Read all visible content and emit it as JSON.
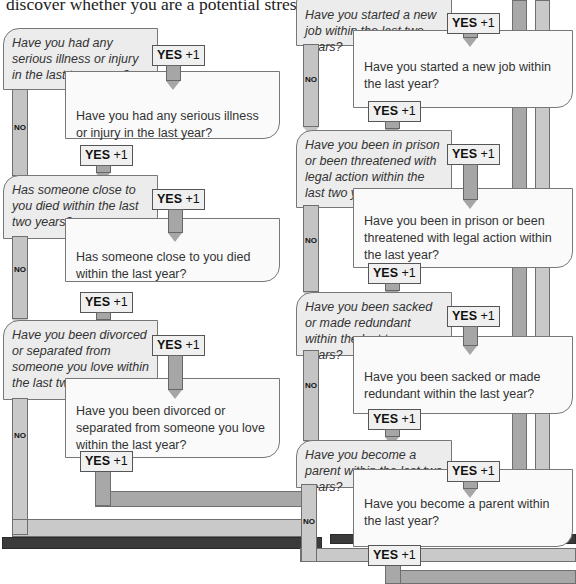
{
  "intro": "discover whether you are a potential stress victim.",
  "yes_label": "YES",
  "yes_points": "+1",
  "no_label": "NO",
  "colors": {
    "bar_mid": "#a8a8a8",
    "bar_light": "#c9c9c9",
    "bar_dark": "#3a3a3a",
    "q2_box": "#ececec",
    "q1_box": "#fafafa"
  },
  "left_column": [
    {
      "two_years": "Have you had any serious illness or injury in the last two years?",
      "last_year": "Have you had any serious illness or injury in the last year?"
    },
    {
      "two_years": "Has someone close to you died within the last two years?",
      "last_year": "Has someone close to you died within the last year?"
    },
    {
      "two_years": "Have you been divorced or separated from someone you love within the last two years?",
      "last_year": "Have you been divorced or separated from someone you love within the last year?"
    }
  ],
  "right_column": [
    {
      "two_years": "Have you started a new job within the last two years?",
      "last_year": "Have you started a new job within the last year?"
    },
    {
      "two_years": "Have you been in prison or been threatened with legal action within the last two years?",
      "last_year": "Have you been in prison or been threatened with legal action within the last year?"
    },
    {
      "two_years": "Have you been sacked or made redundant within the last two years?",
      "last_year": "Have you been sacked or made redundant within the last year?"
    },
    {
      "two_years": "Have you become a parent within the last two years?",
      "last_year": "Have you become a parent within the last year?"
    }
  ]
}
